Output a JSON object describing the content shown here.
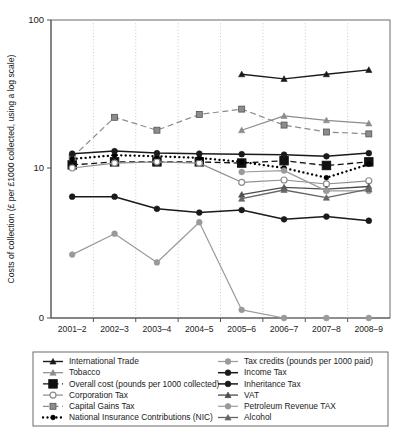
{
  "chart_data": {
    "type": "line",
    "title": "",
    "xlabel": "",
    "ylabel": "Costs of collection (£ per £1000 collected, using a log scale)",
    "yscale": "log",
    "ytick_labels": [
      "100",
      "10",
      "0"
    ],
    "ytick_values": [
      100,
      10,
      0
    ],
    "ylim": [
      0,
      100
    ],
    "grid": true,
    "legend_position": "below",
    "categories": [
      "2001–2",
      "2002–3",
      "2003–4",
      "2004–5",
      "2005–6",
      "2006–7",
      "2007–8",
      "2008–9"
    ],
    "series": [
      {
        "name": "International Trade",
        "color": "#1a1a1a",
        "marker": "triangle",
        "dash": "solid",
        "width": 1.4,
        "values": [
          null,
          null,
          null,
          null,
          43.0,
          40.0,
          43.0,
          46.0
        ]
      },
      {
        "name": "Tobacco",
        "color": "#8c8c8c",
        "marker": "triangle",
        "dash": "solid",
        "width": 1.2,
        "values": [
          null,
          null,
          null,
          null,
          18.0,
          22.5,
          21.0,
          20.0
        ]
      },
      {
        "name": "Overall cost (pounds per 1000 collected)",
        "color": "#111111",
        "marker": "square-large",
        "dash": "dashed",
        "width": 1.3,
        "values": [
          10.5,
          11.0,
          11.0,
          11.0,
          10.8,
          11.2,
          10.4,
          11.0
        ]
      },
      {
        "name": "Corporation Tax",
        "color": "#8c8c8c",
        "marker": "circle-open",
        "dash": "solid",
        "width": 1.2,
        "values": [
          10.0,
          10.8,
          11.0,
          10.8,
          8.0,
          8.3,
          7.8,
          8.2
        ]
      },
      {
        "name": "Capital Gains Tax",
        "color": "#8c8c8c",
        "marker": "square-small",
        "dash": "dashed",
        "width": 1.2,
        "values": [
          11.8,
          22.0,
          18.0,
          23.0,
          25.0,
          19.5,
          17.5,
          17.0
        ]
      },
      {
        "name": "National Insurance Contributions (NIC)",
        "color": "#000000",
        "marker": "dot",
        "dash": "dotted",
        "width": 2.3,
        "values": [
          11.5,
          12.2,
          12.0,
          11.7,
          11.0,
          10.0,
          8.6,
          10.6
        ]
      },
      {
        "name": "Tax credits (pounds per 1000 paid)",
        "color": "#9a9a9a",
        "marker": "circle",
        "dash": "solid",
        "width": 1.2,
        "values": [
          2.6,
          3.6,
          2.3,
          4.3,
          1.1,
          0.9,
          0.35,
          0.55
        ]
      },
      {
        "name": "Income Tax",
        "color": "#1a1a1a",
        "marker": "circle",
        "dash": "solid",
        "width": 1.5,
        "values": [
          12.5,
          13.0,
          12.6,
          12.5,
          12.4,
          12.3,
          12.0,
          12.6
        ]
      },
      {
        "name": "Inheritance Tax",
        "color": "#1a1a1a",
        "marker": "circle",
        "dash": "solid",
        "width": 1.5,
        "values": [
          6.4,
          6.4,
          5.3,
          5.0,
          5.2,
          4.5,
          4.7,
          4.4
        ]
      },
      {
        "name": "VAT",
        "color": "#4d4d4d",
        "marker": "triangle",
        "dash": "solid",
        "width": 1.3,
        "values": [
          null,
          null,
          null,
          null,
          6.6,
          7.4,
          7.2,
          7.5
        ]
      },
      {
        "name": "Petroleum Revenue TAX",
        "color": "#9a9a9a",
        "marker": "circle",
        "dash": "solid",
        "width": 1.2,
        "values": [
          null,
          null,
          null,
          null,
          9.4,
          9.6,
          7.0,
          7.0
        ]
      },
      {
        "name": "Alcohol",
        "color": "#666666",
        "marker": "triangle",
        "dash": "solid",
        "width": 1.3,
        "values": [
          null,
          null,
          null,
          null,
          6.2,
          7.1,
          6.3,
          7.2
        ]
      }
    ]
  },
  "legend": {
    "left_column": [
      "International Trade",
      "Tobacco",
      "Overall cost (pounds per 1000 collected)",
      "Corporation Tax",
      "Capital Gains Tax",
      "National Insurance Contributions (NIC)"
    ],
    "right_column": [
      "Tax credits (pounds per 1000 paid)",
      "Income Tax",
      "Inheritance Tax",
      "VAT",
      "Petroleum Revenue TAX",
      "Alcohol"
    ]
  }
}
